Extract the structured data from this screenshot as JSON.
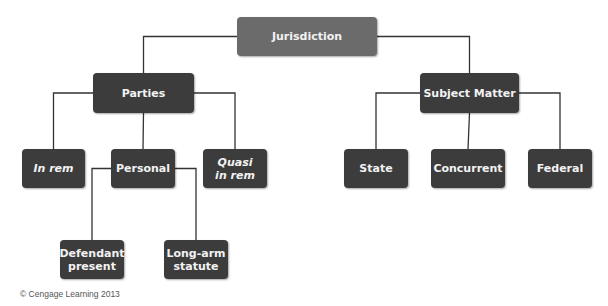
{
  "diagram": {
    "title": "Jurisdiction",
    "nodes": {
      "jurisdiction": {
        "label": "Jurisdiction",
        "italic": false
      },
      "parties": {
        "label": "Parties",
        "italic": false
      },
      "subject_matter": {
        "label": "Subject Matter",
        "italic": false
      },
      "in_rem": {
        "label": "In rem",
        "italic": true
      },
      "personal": {
        "label": "Personal",
        "italic": false
      },
      "quasi_in_rem": {
        "label": "Quasi\nin rem",
        "italic": true
      },
      "state": {
        "label": "State",
        "italic": false
      },
      "concurrent": {
        "label": "Concurrent",
        "italic": false
      },
      "federal": {
        "label": "Federal",
        "italic": false
      },
      "defendant_present": {
        "label": "Defendant\npresent",
        "italic": false
      },
      "long_arm_statute": {
        "label": "Long-arm\nstatute",
        "italic": false
      }
    },
    "edges": [
      [
        "jurisdiction",
        "parties"
      ],
      [
        "jurisdiction",
        "subject_matter"
      ],
      [
        "parties",
        "in_rem"
      ],
      [
        "parties",
        "personal"
      ],
      [
        "parties",
        "quasi_in_rem"
      ],
      [
        "subject_matter",
        "state"
      ],
      [
        "subject_matter",
        "concurrent"
      ],
      [
        "subject_matter",
        "federal"
      ],
      [
        "personal",
        "defendant_present"
      ],
      [
        "personal",
        "long_arm_statute"
      ]
    ],
    "colors": {
      "root_fill": "#6b6b6b",
      "node_fill": "#3c3c3c",
      "text": "#f2f2f2",
      "line": "#333333"
    }
  },
  "credit": "© Cengage Learning 2013"
}
